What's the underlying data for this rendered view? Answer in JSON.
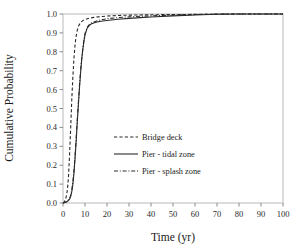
{
  "chart_data": {
    "type": "line",
    "title": "",
    "subtitle": "",
    "xlabel": "Time (yr)",
    "ylabel": "Cumulative Probability",
    "xlim": [
      0,
      100
    ],
    "ylim": [
      0,
      1.0
    ],
    "xticks": [
      0,
      10,
      20,
      30,
      40,
      50,
      60,
      70,
      80,
      90,
      100
    ],
    "xtick_labels": [
      "0",
      "10",
      "20",
      "30",
      "40",
      "50",
      "60",
      "70",
      "80",
      "90",
      "100"
    ],
    "yticks": [
      0.0,
      0.1,
      0.2,
      0.3,
      0.4,
      0.5,
      0.6,
      0.7,
      0.8,
      0.9,
      1.0
    ],
    "ytick_labels": [
      "0.0",
      "0.1",
      "0.2",
      "0.3",
      "0.4",
      "0.5",
      "0.6",
      "0.7",
      "0.8",
      "0.9",
      "1.0"
    ],
    "grid": false,
    "legend_position": "center-left-inside",
    "plot_background": "#ffffff",
    "frame_color": "#b9b9b9",
    "series": [
      {
        "name": "Bridge deck",
        "style": "dashed",
        "color": "#2a2a2a",
        "x": [
          0,
          0.5,
          1,
          1.5,
          2,
          2.5,
          3,
          3.5,
          4,
          4.5,
          5,
          5.5,
          6,
          6.5,
          7,
          8,
          9,
          10,
          12,
          14,
          16,
          18,
          20,
          25,
          30,
          35,
          40,
          50,
          60,
          70,
          80,
          90,
          100
        ],
        "y": [
          0.0,
          0.005,
          0.015,
          0.035,
          0.07,
          0.14,
          0.26,
          0.4,
          0.55,
          0.67,
          0.77,
          0.84,
          0.885,
          0.915,
          0.935,
          0.955,
          0.965,
          0.971,
          0.978,
          0.982,
          0.985,
          0.987,
          0.989,
          0.992,
          0.994,
          0.995,
          0.996,
          0.997,
          0.998,
          0.999,
          1.0,
          1.0,
          1.0
        ]
      },
      {
        "name": "Pier - tidal zone",
        "style": "solid",
        "color": "#2a2a2a",
        "x": [
          0,
          1,
          2,
          3,
          3.5,
          4,
          4.5,
          5,
          5.5,
          6,
          6.5,
          7,
          7.5,
          8,
          8.5,
          9,
          9.5,
          10,
          11,
          12,
          13,
          14,
          15,
          16,
          18,
          20,
          25,
          30,
          35,
          40,
          50,
          60,
          70,
          80,
          90,
          100
        ],
        "y": [
          0.0,
          0.003,
          0.008,
          0.02,
          0.035,
          0.06,
          0.1,
          0.16,
          0.24,
          0.33,
          0.43,
          0.52,
          0.61,
          0.69,
          0.76,
          0.81,
          0.855,
          0.89,
          0.925,
          0.94,
          0.948,
          0.952,
          0.956,
          0.959,
          0.963,
          0.966,
          0.972,
          0.977,
          0.981,
          0.984,
          0.99,
          0.995,
          0.999,
          1.0,
          1.0,
          1.0
        ]
      },
      {
        "name": "Pier - splash zone",
        "style": "dash-dot",
        "color": "#2a2a2a",
        "x": [
          0,
          1,
          2,
          3,
          3.5,
          4,
          4.5,
          5,
          5.5,
          6,
          6.5,
          7,
          7.5,
          8,
          8.5,
          9,
          9.5,
          10,
          11,
          12,
          13,
          14,
          15,
          16,
          18,
          20,
          25,
          30,
          35,
          40,
          50,
          60,
          70,
          80,
          90,
          100
        ],
        "y": [
          0.0,
          0.004,
          0.01,
          0.024,
          0.042,
          0.07,
          0.115,
          0.175,
          0.255,
          0.345,
          0.445,
          0.535,
          0.625,
          0.7,
          0.765,
          0.818,
          0.862,
          0.896,
          0.93,
          0.945,
          0.953,
          0.958,
          0.962,
          0.966,
          0.971,
          0.975,
          0.981,
          0.985,
          0.988,
          0.99,
          0.994,
          0.997,
          1.0,
          1.0,
          1.0,
          1.0
        ]
      }
    ]
  },
  "legend": {
    "items": [
      {
        "label": "Bridge deck",
        "style": "dashed"
      },
      {
        "label": "Pier - tidal zone",
        "style": "solid"
      },
      {
        "label": "Pier - splash zone",
        "style": "dash-dot"
      }
    ]
  }
}
